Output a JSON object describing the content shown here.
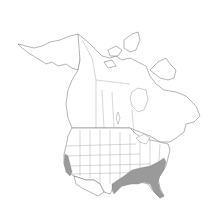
{
  "map": {
    "title": "",
    "region": "North America",
    "colors": {
      "background": "#ffffff",
      "land": "#ffffff",
      "outline": "#6a6a6a",
      "range_fill": "#9a9a9a"
    },
    "shaded_regions": [
      "California coast",
      "Texas (east)",
      "Louisiana",
      "Arkansas",
      "Mississippi",
      "Tennessee",
      "Alabama",
      "Georgia",
      "Florida",
      "South Carolina",
      "North Carolina",
      "Virginia (southeast)"
    ]
  }
}
